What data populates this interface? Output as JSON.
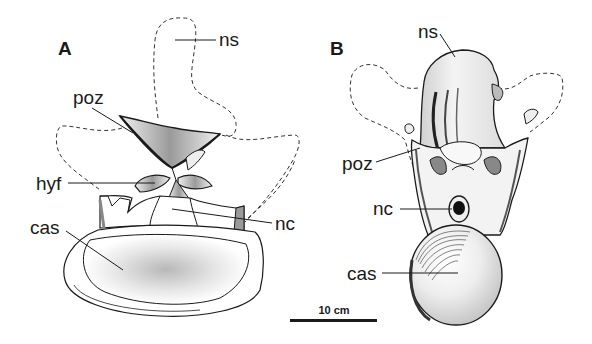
{
  "figure": {
    "panels": [
      {
        "id": "A",
        "label": "A",
        "labels": {
          "ns": "ns",
          "poz": "poz",
          "hyf": "hyf",
          "nc": "nc",
          "cas": "cas"
        }
      },
      {
        "id": "B",
        "label": "B",
        "labels": {
          "ns": "ns",
          "poz": "poz",
          "nc": "nc",
          "cas": "cas"
        }
      }
    ],
    "scale_bar": {
      "label": "10 cm"
    },
    "colors": {
      "ink": "#1a1a1a",
      "background": "#ffffff",
      "stipple": "#8a8a8a"
    }
  }
}
